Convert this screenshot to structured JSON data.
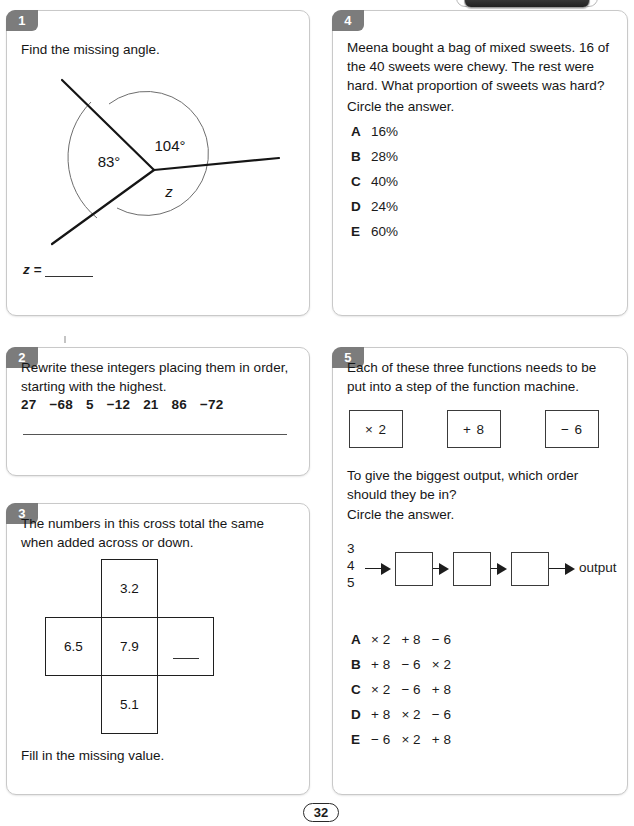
{
  "page": {
    "number": "32"
  },
  "q1": {
    "tab": "1",
    "prompt": "Find the missing angle.",
    "angle_a": "83°",
    "angle_b": "104°",
    "angle_unknown": "z",
    "answer_label": "z =",
    "answer_value": ""
  },
  "q2": {
    "tab": "2",
    "prompt": "Rewrite these integers placing them in order, starting with the highest.",
    "numbers": [
      "27",
      "−68",
      "5",
      "−12",
      "21",
      "86",
      "−72"
    ],
    "answer_value": ""
  },
  "q3": {
    "tab": "3",
    "prompt": "The numbers in this cross total the same when added across or down.",
    "cells": {
      "top": "3.2",
      "left": "6.5",
      "centre": "7.9",
      "right": "",
      "bottom": "5.1"
    },
    "footer": "Fill in the missing value."
  },
  "q4": {
    "tab": "4",
    "prompt": "Meena bought a bag of mixed sweets. 16 of the 40 sweets were chewy. The rest were hard. What proportion of sweets was hard?",
    "instruction": "Circle the answer.",
    "options": [
      {
        "letter": "A",
        "text": "16%"
      },
      {
        "letter": "B",
        "text": "28%"
      },
      {
        "letter": "C",
        "text": "40%"
      },
      {
        "letter": "D",
        "text": "24%"
      },
      {
        "letter": "E",
        "text": "60%"
      }
    ]
  },
  "q5": {
    "tab": "5",
    "prompt": "Each of these three functions needs to be put into a step of the function machine.",
    "functions": [
      "× 2",
      "+ 8",
      "− 6"
    ],
    "prompt2": "To give the biggest output, which order should they be in?",
    "instruction": "Circle the answer.",
    "machine": {
      "inputs": [
        "3",
        "4",
        "5"
      ],
      "steps": [
        "",
        "",
        ""
      ],
      "output_label": "output"
    },
    "options": [
      {
        "letter": "A",
        "text": "× 2   + 8   − 6"
      },
      {
        "letter": "B",
        "text": "+ 8   − 6   × 2"
      },
      {
        "letter": "C",
        "text": "× 2   − 6   + 8"
      },
      {
        "letter": "D",
        "text": "+ 8   × 2   − 6"
      },
      {
        "letter": "E",
        "text": "− 6   × 2   + 8"
      }
    ]
  }
}
